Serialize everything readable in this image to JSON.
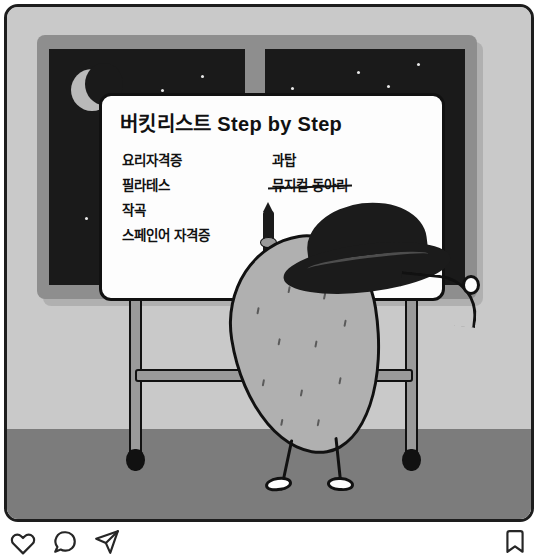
{
  "post": {
    "type": "instagram-photo-post",
    "panel_alt": "night-room-illustration"
  },
  "illustration": {
    "scene": "night room with window, easel whiteboard and potato character",
    "colors": {
      "wall": "#c9c9c9",
      "floor": "#7c7c7c",
      "night_sky": "#1a1a1a",
      "window_frame": "#8e8e8e",
      "board": "#fdfdfd",
      "ink": "#111111",
      "character_body": "#b0b0b0",
      "hat": "#1b1b1b",
      "moon": "#b9b9b9"
    },
    "moon": "crescent-moon",
    "stars_count": 12,
    "character": {
      "name": "potato-character",
      "accessory": "wide-brim-hat",
      "holding": "marker-pen-on-string"
    }
  },
  "whiteboard": {
    "title": "버킷리스트 Step by Step",
    "columns": [
      {
        "name": "left-column",
        "items": [
          {
            "text": "요리자격증",
            "done": false
          },
          {
            "text": "필라테스",
            "done": false
          },
          {
            "text": "작곡",
            "done": false
          },
          {
            "text": "스페인어 자격증",
            "done": false
          }
        ]
      },
      {
        "name": "right-column",
        "items": [
          {
            "text": "과탑",
            "done": false
          },
          {
            "text": "뮤지컬 동아리",
            "done": true
          }
        ]
      }
    ]
  },
  "action_bar": {
    "buttons": [
      {
        "name": "like-button",
        "icon": "heart-icon"
      },
      {
        "name": "comment-button",
        "icon": "comment-icon"
      },
      {
        "name": "share-button",
        "icon": "share-icon"
      }
    ],
    "save": {
      "name": "save-button",
      "icon": "bookmark-icon"
    }
  }
}
